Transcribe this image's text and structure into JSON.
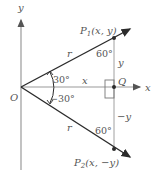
{
  "diagram": {
    "axes": {
      "x_label": "x",
      "y_label": "y",
      "origin_label": "O"
    },
    "points": {
      "p1": {
        "name": "P",
        "sub": "1",
        "coords": "(x, y)"
      },
      "p2": {
        "name": "P",
        "sub": "2",
        "coords": "(x, −y)"
      },
      "q": {
        "label": "Q"
      }
    },
    "segments": {
      "r_upper": "r",
      "r_lower": "r",
      "x_seg": "x",
      "y_up": "y",
      "y_down": "−y"
    },
    "angles": {
      "upper_origin": "30°",
      "lower_origin": "−30°",
      "upper_p1": "60°",
      "lower_p2": "60°"
    },
    "colors": {
      "line": "#2b2b2b",
      "axis": "#9a9a9a",
      "text": "#555555"
    }
  }
}
